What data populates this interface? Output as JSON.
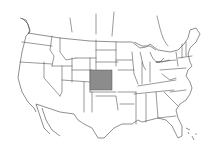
{
  "map": {
    "region": "United States",
    "style": "state outlines",
    "highlighted_state": {
      "name": "Kansas",
      "fill_color": "#8c8c8c"
    },
    "colors": {
      "background": "#ffffff",
      "border": "#555555",
      "highlight": "#8c8c8c"
    }
  }
}
